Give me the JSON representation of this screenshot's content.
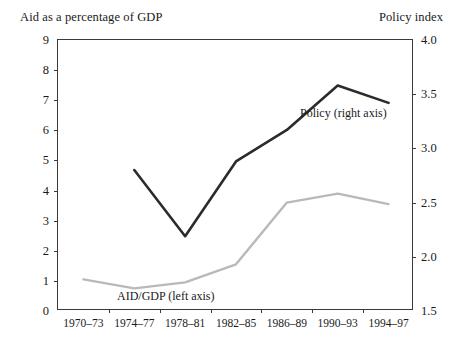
{
  "left_axis_title": "Aid as a percentage of GDP",
  "right_axis_title": "Policy index",
  "annotations": {
    "policy": "Policy (right axis)",
    "aidgdp": "AID/GDP (left axis)"
  },
  "colors": {
    "policy_line": "#2b2b2b",
    "aidgdp_line": "#b9b9b9",
    "axis": "#3a3a3a",
    "text": "#1a1a1a",
    "background": "#ffffff"
  },
  "chart_data": {
    "type": "line",
    "title": "",
    "xlabel": "",
    "ylabel": "Aid as a percentage of GDP",
    "y2label": "Policy index",
    "grid": false,
    "legend": "inline-annotations",
    "categories": [
      "1970–73",
      "1974–77",
      "1978–81",
      "1982–85",
      "1986–89",
      "1990–93",
      "1994–97"
    ],
    "ylim": [
      0,
      9
    ],
    "yticks": [
      "0",
      "1",
      "2",
      "3",
      "4",
      "5",
      "6",
      "7",
      "8",
      "9"
    ],
    "y2lim": [
      1.5,
      4.0
    ],
    "y2ticks": [
      "1.5",
      "2.0",
      "2.5",
      "3.0",
      "3.5",
      "4.0"
    ],
    "series": [
      {
        "name": "AID/GDP (left axis)",
        "axis": "left",
        "color": "#b9b9b9",
        "values": [
          1.05,
          0.75,
          0.95,
          1.55,
          3.6,
          3.9,
          3.55
        ]
      },
      {
        "name": "Policy (right axis)",
        "axis": "right",
        "color": "#2b2b2b",
        "values": [
          null,
          2.8,
          2.19,
          2.88,
          3.17,
          3.58,
          3.42
        ]
      }
    ]
  }
}
